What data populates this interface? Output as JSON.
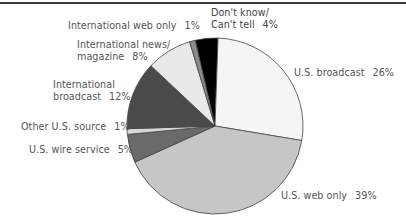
{
  "chart_data": {
    "type": "pie",
    "title": "",
    "slices": [
      {
        "label": "Don't know/ Can't tell",
        "value": 4,
        "color": "#000000"
      },
      {
        "label": "U.S. broadcast",
        "value": 26,
        "color": "#f5f5f5"
      },
      {
        "label": "U.S. web only",
        "value": 39,
        "color": "#c6c6c6"
      },
      {
        "label": "U.S. wire service",
        "value": 5,
        "color": "#6a6a6a"
      },
      {
        "label": "Other U.S. source",
        "value": 1,
        "color": "#d8d8d8"
      },
      {
        "label": "International broadcast",
        "value": 12,
        "color": "#4a4a4a"
      },
      {
        "label": "International news/ magazine",
        "value": 8,
        "color": "#e9e9e9"
      },
      {
        "label": "International web only",
        "value": 1,
        "color": "#8c8c8c"
      }
    ],
    "legend_position": "labels around pie"
  },
  "labels": {
    "dont_know_line1": "Don't know/",
    "dont_know_line2": "Can't tell",
    "dont_know_pct": "4%",
    "us_broadcast": "U.S. broadcast",
    "us_broadcast_pct": "26%",
    "us_web_only": "U.S. web only",
    "us_web_only_pct": "39%",
    "us_wire": "U.S. wire service",
    "us_wire_pct": "5%",
    "other_us": "Other U.S. source",
    "other_us_pct": "1%",
    "intl_broadcast_line1": "International",
    "intl_broadcast_line2": "broadcast",
    "intl_broadcast_pct": "12%",
    "intl_news_line1": "International news/",
    "intl_news_line2": "magazine",
    "intl_news_pct": "8%",
    "intl_web": "International web only",
    "intl_web_pct": "1%"
  }
}
